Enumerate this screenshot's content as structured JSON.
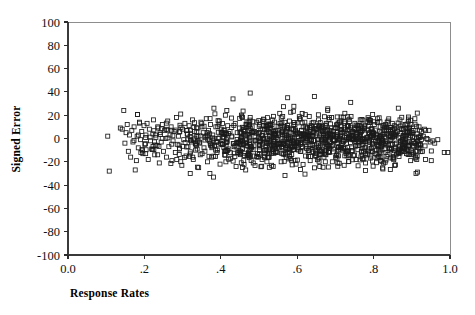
{
  "chart_data": {
    "type": "scatter",
    "title": "",
    "xlabel": "Response Rates",
    "ylabel": "Signed Error",
    "xlim": [
      0.0,
      1.0
    ],
    "ylim": [
      -100,
      100
    ],
    "grid": false,
    "legend": null,
    "marker": {
      "shape": "open-square",
      "size_px": 4,
      "edge_color": "#1a1a1a",
      "face_color": "none"
    },
    "xticks": [
      0.0,
      0.2,
      0.4,
      0.6,
      0.8,
      1.0
    ],
    "xtick_labels": [
      "0.0",
      ".2",
      ".4",
      ".6",
      ".8",
      "1.0"
    ],
    "yticks": [
      100,
      80,
      60,
      40,
      20,
      0,
      -20,
      -40,
      -60,
      -80,
      -100
    ],
    "ytick_labels": [
      "100",
      "80",
      "60",
      "40",
      "20",
      "0",
      "-20",
      "-40",
      "-60",
      "-80",
      "-100"
    ],
    "n_points": 902,
    "x_data_range": [
      0.1,
      1.0
    ],
    "y_data_range": [
      -40,
      40
    ],
    "points": [
      [
        0.104,
        2
      ],
      [
        0.108,
        -28
      ],
      [
        0.137,
        9
      ],
      [
        0.142,
        8
      ],
      [
        0.146,
        24
      ],
      [
        0.149,
        -4
      ],
      [
        0.152,
        5
      ],
      [
        0.155,
        12
      ],
      [
        0.158,
        -11
      ],
      [
        0.161,
        3
      ],
      [
        0.164,
        -16
      ],
      [
        0.167,
        7
      ],
      [
        0.17,
        -3
      ],
      [
        0.173,
        10
      ],
      [
        0.176,
        -27
      ],
      [
        0.179,
        -19
      ],
      [
        0.181,
        2
      ],
      [
        0.184,
        -8
      ],
      [
        0.187,
        14
      ],
      [
        0.19,
        -1
      ],
      [
        0.193,
        6
      ],
      [
        0.196,
        -13
      ],
      [
        0.199,
        11
      ],
      [
        0.201,
        -5
      ],
      [
        0.204,
        3
      ],
      [
        0.207,
        13
      ],
      [
        0.21,
        -18
      ],
      [
        0.213,
        8
      ],
      [
        0.216,
        -2
      ],
      [
        0.219,
        -9
      ],
      [
        0.222,
        4
      ],
      [
        0.224,
        16
      ],
      [
        0.227,
        -14
      ],
      [
        0.23,
        1
      ],
      [
        0.233,
        -6
      ],
      [
        0.236,
        9
      ],
      [
        0.239,
        -21
      ],
      [
        0.241,
        5
      ],
      [
        0.244,
        -3
      ],
      [
        0.247,
        12
      ],
      [
        0.25,
        -11
      ],
      [
        0.253,
        7
      ],
      [
        0.256,
        0
      ],
      [
        0.258,
        -16
      ],
      [
        0.261,
        15
      ],
      [
        0.264,
        -7
      ],
      [
        0.267,
        3
      ],
      [
        0.27,
        10
      ],
      [
        0.272,
        -19
      ],
      [
        0.275,
        -2
      ],
      [
        0.278,
        6
      ],
      [
        0.281,
        -12
      ],
      [
        0.284,
        18
      ],
      [
        0.286,
        -5
      ],
      [
        0.289,
        2
      ],
      [
        0.292,
        -9
      ],
      [
        0.295,
        21
      ],
      [
        0.298,
        -23
      ],
      [
        0.3,
        8
      ],
      [
        0.303,
        -1
      ],
      [
        0.306,
        13
      ],
      [
        0.309,
        -15
      ],
      [
        0.312,
        4
      ],
      [
        0.314,
        -7
      ],
      [
        0.317,
        11
      ],
      [
        0.32,
        -30
      ],
      [
        0.323,
        -3
      ],
      [
        0.326,
        16
      ],
      [
        0.328,
        -18
      ],
      [
        0.331,
        6
      ],
      [
        0.334,
        -10
      ],
      [
        0.337,
        2
      ],
      [
        0.34,
        9
      ],
      [
        0.342,
        -25
      ],
      [
        0.345,
        -4
      ],
      [
        0.348,
        14
      ],
      [
        0.351,
        -13
      ],
      [
        0.354,
        5
      ],
      [
        0.356,
        -8
      ],
      [
        0.359,
        1
      ],
      [
        0.362,
        17
      ],
      [
        0.365,
        -20
      ],
      [
        0.368,
        7
      ],
      [
        0.37,
        -2
      ],
      [
        0.373,
        12
      ],
      [
        0.376,
        -16
      ],
      [
        0.379,
        3
      ],
      [
        0.382,
        26
      ],
      [
        0.384,
        -6
      ],
      [
        0.387,
        10
      ],
      [
        0.39,
        -12
      ],
      [
        0.393,
        0
      ],
      [
        0.396,
        15
      ],
      [
        0.398,
        -22
      ],
      [
        0.401,
        8
      ],
      [
        0.404,
        -5
      ],
      [
        0.407,
        4
      ],
      [
        0.41,
        -14
      ],
      [
        0.412,
        20
      ],
      [
        0.415,
        -1
      ],
      [
        0.418,
        11
      ],
      [
        0.421,
        -9
      ],
      [
        0.424,
        6
      ],
      [
        0.426,
        -17
      ],
      [
        0.429,
        2
      ],
      [
        0.432,
        34
      ],
      [
        0.435,
        -7
      ],
      [
        0.438,
        13
      ],
      [
        0.44,
        -24
      ],
      [
        0.443,
        5
      ],
      [
        0.446,
        -3
      ],
      [
        0.449,
        9
      ],
      [
        0.452,
        -11
      ],
      [
        0.454,
        1
      ],
      [
        0.457,
        18
      ],
      [
        0.46,
        -19
      ],
      [
        0.463,
        7
      ],
      [
        0.466,
        -4
      ],
      [
        0.468,
        12
      ],
      [
        0.471,
        -15
      ],
      [
        0.474,
        3
      ],
      [
        0.477,
        39
      ],
      [
        0.48,
        -8
      ],
      [
        0.482,
        10
      ],
      [
        0.485,
        -21
      ],
      [
        0.488,
        6
      ],
      [
        0.491,
        -2
      ],
      [
        0.494,
        14
      ],
      [
        0.496,
        -13
      ],
      [
        0.499,
        4
      ],
      [
        0.502,
        -6
      ],
      [
        0.505,
        8
      ],
      [
        0.508,
        -18
      ],
      [
        0.51,
        0
      ],
      [
        0.513,
        16
      ],
      [
        0.516,
        -10
      ],
      [
        0.519,
        5
      ],
      [
        0.522,
        -16
      ],
      [
        0.524,
        11
      ],
      [
        0.527,
        -3
      ],
      [
        0.53,
        9
      ],
      [
        0.533,
        -23
      ],
      [
        0.536,
        2
      ],
      [
        0.538,
        19
      ],
      [
        0.541,
        -7
      ],
      [
        0.544,
        7
      ],
      [
        0.547,
        -12
      ],
      [
        0.55,
        4
      ],
      [
        0.552,
        -1
      ],
      [
        0.555,
        13
      ],
      [
        0.558,
        -20
      ],
      [
        0.561,
        6
      ],
      [
        0.564,
        -5
      ],
      [
        0.566,
        10
      ],
      [
        0.569,
        -14
      ],
      [
        0.572,
        1
      ],
      [
        0.575,
        35
      ],
      [
        0.578,
        -9
      ],
      [
        0.58,
        15
      ],
      [
        0.583,
        -17
      ],
      [
        0.586,
        3
      ],
      [
        0.589,
        8
      ],
      [
        0.592,
        -4
      ],
      [
        0.594,
        12
      ],
      [
        0.597,
        -22
      ],
      [
        0.6,
        5
      ],
      [
        0.603,
        -2
      ],
      [
        0.606,
        17
      ],
      [
        0.608,
        -11
      ],
      [
        0.611,
        7
      ],
      [
        0.614,
        -8
      ],
      [
        0.617,
        0
      ],
      [
        0.62,
        14
      ],
      [
        0.622,
        -15
      ],
      [
        0.625,
        9
      ],
      [
        0.628,
        -3
      ],
      [
        0.631,
        6
      ],
      [
        0.634,
        -19
      ],
      [
        0.636,
        11
      ],
      [
        0.639,
        -6
      ],
      [
        0.642,
        2
      ],
      [
        0.645,
        36
      ],
      [
        0.648,
        -13
      ],
      [
        0.65,
        8
      ],
      [
        0.653,
        -1
      ],
      [
        0.656,
        16
      ],
      [
        0.659,
        -24
      ],
      [
        0.662,
        4
      ],
      [
        0.664,
        -9
      ],
      [
        0.667,
        10
      ],
      [
        0.67,
        -16
      ],
      [
        0.673,
        1
      ],
      [
        0.676,
        13
      ],
      [
        0.678,
        -5
      ],
      [
        0.681,
        7
      ],
      [
        0.684,
        -12
      ],
      [
        0.687,
        3
      ],
      [
        0.69,
        18
      ],
      [
        0.692,
        -20
      ],
      [
        0.695,
        6
      ],
      [
        0.698,
        -2
      ],
      [
        0.701,
        9
      ],
      [
        0.704,
        -17
      ],
      [
        0.706,
        12
      ],
      [
        0.709,
        -7
      ],
      [
        0.712,
        0
      ],
      [
        0.715,
        15
      ],
      [
        0.718,
        -10
      ],
      [
        0.72,
        5
      ],
      [
        0.723,
        -23
      ],
      [
        0.726,
        8
      ],
      [
        0.729,
        -4
      ],
      [
        0.732,
        11
      ],
      [
        0.734,
        -14
      ],
      [
        0.737,
        2
      ],
      [
        0.74,
        31
      ],
      [
        0.743,
        -8
      ],
      [
        0.746,
        6
      ],
      [
        0.748,
        -1
      ],
      [
        0.751,
        13
      ],
      [
        0.754,
        -18
      ],
      [
        0.757,
        4
      ],
      [
        0.76,
        9
      ],
      [
        0.762,
        -6
      ],
      [
        0.765,
        16
      ],
      [
        0.768,
        -11
      ],
      [
        0.771,
        7
      ],
      [
        0.774,
        -3
      ],
      [
        0.776,
        10
      ],
      [
        0.779,
        -21
      ],
      [
        0.782,
        1
      ],
      [
        0.785,
        14
      ],
      [
        0.788,
        -9
      ],
      [
        0.79,
        5
      ],
      [
        0.793,
        -15
      ],
      [
        0.796,
        8
      ],
      [
        0.799,
        -2
      ],
      [
        0.802,
        12
      ],
      [
        0.804,
        -13
      ],
      [
        0.807,
        3
      ],
      [
        0.81,
        17
      ],
      [
        0.813,
        -7
      ],
      [
        0.816,
        6
      ],
      [
        0.818,
        -19
      ],
      [
        0.821,
        0
      ],
      [
        0.824,
        11
      ],
      [
        0.827,
        -5
      ],
      [
        0.83,
        9
      ],
      [
        0.832,
        -12
      ],
      [
        0.835,
        4
      ],
      [
        0.838,
        15
      ],
      [
        0.841,
        -8
      ],
      [
        0.844,
        7
      ],
      [
        0.846,
        -1
      ],
      [
        0.849,
        13
      ],
      [
        0.852,
        -16
      ],
      [
        0.855,
        2
      ],
      [
        0.858,
        10
      ],
      [
        0.86,
        -4
      ],
      [
        0.863,
        6
      ],
      [
        0.866,
        -10
      ],
      [
        0.869,
        16
      ],
      [
        0.872,
        -2
      ],
      [
        0.874,
        8
      ],
      [
        0.877,
        -6
      ],
      [
        0.88,
        3
      ],
      [
        0.883,
        12
      ],
      [
        0.886,
        -13
      ],
      [
        0.888,
        5
      ],
      [
        0.891,
        -3
      ],
      [
        0.894,
        9
      ],
      [
        0.897,
        -19
      ],
      [
        0.9,
        7
      ],
      [
        0.902,
        1
      ],
      [
        0.905,
        -7
      ],
      [
        0.908,
        17
      ],
      [
        0.911,
        -30
      ],
      [
        0.914,
        4
      ],
      [
        0.916,
        -2
      ],
      [
        0.919,
        10
      ],
      [
        0.922,
        -5
      ],
      [
        0.925,
        6
      ],
      [
        0.928,
        -11
      ],
      [
        0.93,
        2
      ],
      [
        0.933,
        8
      ],
      [
        0.936,
        -18
      ],
      [
        0.939,
        0
      ],
      [
        0.942,
        -1
      ],
      [
        0.945,
        7
      ],
      [
        0.948,
        -3
      ],
      [
        0.951,
        -19
      ],
      [
        0.955,
        -2
      ],
      [
        0.96,
        -4
      ],
      [
        0.968,
        -1
      ],
      [
        0.985,
        -12
      ],
      [
        0.994,
        -12
      ]
    ]
  },
  "axes": {
    "x_axis_name": "response-rates-axis",
    "y_axis_name": "signed-error-axis"
  }
}
